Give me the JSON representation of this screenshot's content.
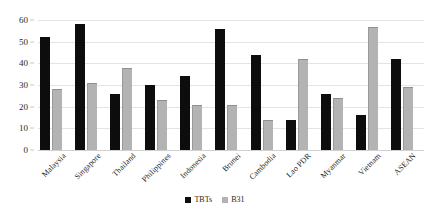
{
  "chart_data": {
    "type": "bar",
    "title": "",
    "subtitle": "",
    "xlabel": "",
    "ylabel": "",
    "ylim": [
      0,
      60
    ],
    "ytick_labels": [
      "0",
      "10",
      "20",
      "30",
      "40",
      "50",
      "60"
    ],
    "yticks": [
      0,
      10,
      20,
      30,
      40,
      50,
      60
    ],
    "grid": true,
    "legend_position": "bottom-center",
    "categories": [
      "Malaysia",
      "Singapore",
      "Thailand",
      "Philippines",
      "Indonesia",
      "Brunei",
      "Cambodia",
      "Lao PDR",
      "Myanmar",
      "Vietnam",
      "ASEAN"
    ],
    "series": [
      {
        "name": "TBTs",
        "color": "#0d0d0d",
        "values": [
          52,
          58,
          26,
          30,
          34,
          56,
          44,
          14,
          26,
          16,
          42
        ]
      },
      {
        "name": "B31",
        "color": "#b3b3b3",
        "values": [
          28,
          31,
          38,
          23,
          21,
          21,
          14,
          42,
          24,
          57,
          29
        ]
      }
    ]
  },
  "legend": {
    "items": [
      {
        "label": "TBTs",
        "swatch": "black-square-marker"
      },
      {
        "label": "B31",
        "swatch": "gray-square-marker"
      }
    ]
  }
}
